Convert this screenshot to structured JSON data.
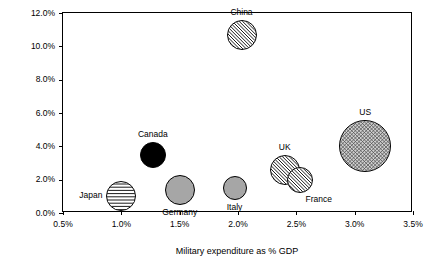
{
  "chart_data": {
    "type": "scatter",
    "title": "",
    "xlabel": "Military expenditure as % GDP",
    "ylabel": "Growth trajectory (annual growth rate)",
    "xlim": [
      0.5,
      3.5
    ],
    "ylim": [
      0.0,
      12.0
    ],
    "xticks": [
      "0.5%",
      "1.0%",
      "1.5%",
      "2.0%",
      "2.5%",
      "3.0%",
      "3.5%"
    ],
    "yticks": [
      "0.0%",
      "2.0%",
      "4.0%",
      "6.0%",
      "8.0%",
      "10.0%",
      "12.0%"
    ],
    "grid": false,
    "legend": "none",
    "points": [
      {
        "name": "Japan",
        "x": 1.0,
        "y": 1.0,
        "size": 30,
        "fill": "#ffffff",
        "pattern": "horizontal-lines",
        "label": "Japan",
        "label_pos": "left"
      },
      {
        "name": "Canada",
        "x": 1.27,
        "y": 3.5,
        "size": 26,
        "fill": "#000000",
        "pattern": "solid",
        "label": "Canada",
        "label_pos": "above"
      },
      {
        "name": "Germany",
        "x": 1.5,
        "y": 1.4,
        "size": 30,
        "fill": "#a6a6a6",
        "pattern": "solid",
        "label": "Germany",
        "label_pos": "below"
      },
      {
        "name": "Italy",
        "x": 1.97,
        "y": 1.5,
        "size": 24,
        "fill": "#a6a6a6",
        "pattern": "solid",
        "label": "Italy",
        "label_pos": "below"
      },
      {
        "name": "China",
        "x": 2.03,
        "y": 10.7,
        "size": 30,
        "fill": "#ffffff",
        "pattern": "diagonal-lines",
        "label": "China",
        "label_pos": "above"
      },
      {
        "name": "UK",
        "x": 2.4,
        "y": 2.6,
        "size": 30,
        "fill": "#ffffff",
        "pattern": "diagonal-lines",
        "label": "UK",
        "label_pos": "above"
      },
      {
        "name": "France",
        "x": 2.53,
        "y": 2.0,
        "size": 26,
        "fill": "#ffffff",
        "pattern": "diagonal-lines",
        "label": "France",
        "label_pos": "below-right"
      },
      {
        "name": "US",
        "x": 3.09,
        "y": 4.0,
        "size": 52,
        "fill": "#cfcfcf",
        "pattern": "crosshatch",
        "label": "US",
        "label_pos": "above"
      }
    ]
  }
}
